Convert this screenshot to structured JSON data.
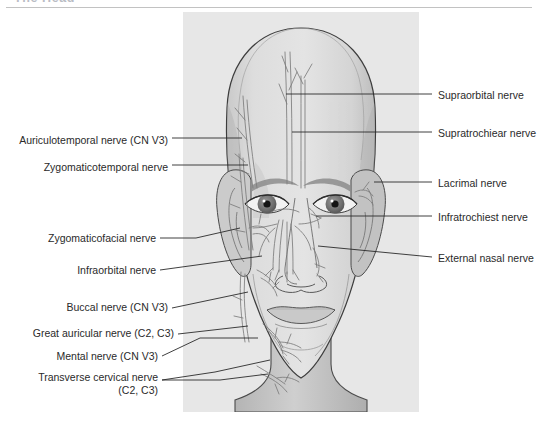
{
  "header": {
    "title": "The Head"
  },
  "figure": {
    "view": "anterior-view-of-head-and-face",
    "panel_color": "#e7e7e7",
    "line_color": "#3a3a3a",
    "skin_color": "#d9d9d9",
    "nerve_color": "#8c8c8c"
  },
  "labels_left": [
    {
      "id": "auriculotemporal",
      "text": "Auriculotemporal nerve (CN V3)",
      "sub": "",
      "x": 20,
      "y": 134
    },
    {
      "id": "zygomaticotemporal",
      "text": "Zygomaticotemporal nerve",
      "sub": "",
      "x": 31,
      "y": 161
    },
    {
      "id": "zygomaticofacial",
      "text": "Zygomaticofacial nerve",
      "sub": "",
      "x": 47,
      "y": 235
    },
    {
      "id": "infraorbital",
      "text": "Infraorbital nerve",
      "sub": "",
      "x": 78,
      "y": 266
    },
    {
      "id": "buccal",
      "text": "Buccal nerve (CN V3)",
      "sub": "",
      "x": 67,
      "y": 304
    },
    {
      "id": "great-auricular",
      "text": "Great auricular nerve (C2, C3)",
      "sub": "",
      "x": 27,
      "y": 330
    },
    {
      "id": "mental",
      "text": "Mental nerve (CN V3)",
      "sub": "",
      "x": 66,
      "y": 354
    },
    {
      "id": "transverse-cervical",
      "text": "Transverse cervical nerve",
      "sub": "(C2, C3)",
      "x": 48,
      "y": 374
    }
  ],
  "labels_right": [
    {
      "id": "supraorbital",
      "text": "Supraorbital nerve",
      "x": 438,
      "y": 90
    },
    {
      "id": "supratrochlear",
      "text": "Supratrochiear nerve",
      "x": 438,
      "y": 128
    },
    {
      "id": "lacrimal",
      "text": "Lacrimal nerve",
      "x": 438,
      "y": 178
    },
    {
      "id": "infratrochlear",
      "text": "Infratrochiest nerve",
      "x": 438,
      "y": 212
    },
    {
      "id": "external-nasal",
      "text": "External nasal nerve",
      "x": 438,
      "y": 253
    }
  ]
}
